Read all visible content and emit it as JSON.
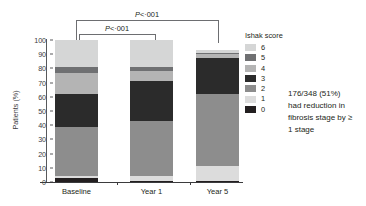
{
  "chart_data": {
    "type": "bar",
    "subtype": "stacked-bar-100",
    "title": "",
    "xlabel": "",
    "ylabel": "Patients (%)",
    "ylim": [
      0,
      100
    ],
    "ytick_values": [
      0,
      10,
      20,
      30,
      40,
      50,
      60,
      70,
      80,
      90,
      100
    ],
    "ytick_labels": [
      "0",
      "10",
      "20",
      "30",
      "40",
      "50",
      "60",
      "70",
      "80",
      "90",
      "100"
    ],
    "grid": false,
    "categories": [
      "Baseline",
      "Year 1",
      "Year 5"
    ],
    "legend_title": "Ishak score",
    "legend_position": "right",
    "legend_order_top_to_bottom": [
      "6",
      "5",
      "4",
      "3",
      "2",
      "1",
      "0"
    ],
    "series": [
      {
        "name": "0",
        "color": "#231f20",
        "values": [
          3,
          1,
          1
        ]
      },
      {
        "name": "1",
        "color": "#dcdcdc",
        "values": [
          1,
          3,
          10
        ]
      },
      {
        "name": "2",
        "color": "#8d8d8d",
        "values": [
          35,
          39,
          51
        ]
      },
      {
        "name": "3",
        "color": "#2b2b2b",
        "values": [
          23,
          28,
          25
        ]
      },
      {
        "name": "4",
        "color": "#b4b4b4",
        "values": [
          15,
          7,
          3
        ]
      },
      {
        "name": "5",
        "color": "#6f7072",
        "values": [
          4,
          3,
          1
        ]
      },
      {
        "name": "6",
        "color": "#d5d6d6",
        "values": [
          19,
          19,
          2
        ]
      }
    ],
    "bar_totals": [
      100,
      100,
      93
    ],
    "annotations": [
      {
        "name": "bracket-baseline-year1",
        "text": "P<·001",
        "from": "Baseline",
        "to": "Year 1"
      },
      {
        "name": "bracket-baseline-year5",
        "text": "P<·001",
        "from": "Baseline",
        "to": "Year 5"
      }
    ],
    "side_note": [
      "176/348 (51%)",
      "had reduction in",
      "fibrosis stage by ≥",
      "1 stage"
    ]
  },
  "axes": {
    "y_label": "Patients (%)",
    "y_ticks": [
      "100",
      "90",
      "80",
      "70",
      "60",
      "50",
      "40",
      "30",
      "20",
      "10",
      "0"
    ],
    "x_labels": [
      "Baseline",
      "Year 1",
      "Year 5"
    ]
  },
  "legend": {
    "title": "Ishak score",
    "items": [
      {
        "label": "6",
        "color": "#d5d6d6"
      },
      {
        "label": "5",
        "color": "#6f7072"
      },
      {
        "label": "4",
        "color": "#b4b4b4"
      },
      {
        "label": "3",
        "color": "#2b2b2b"
      },
      {
        "label": "2",
        "color": "#8d8d8d"
      },
      {
        "label": "1",
        "color": "#dcdcdc"
      },
      {
        "label": "0",
        "color": "#231f20"
      }
    ]
  },
  "brackets": {
    "inner_label_prefix": "P",
    "inner_label_rest": "<·001",
    "outer_label_prefix": "P",
    "outer_label_rest": "<·001"
  },
  "note": {
    "line1": "176/348 (51%)",
    "line2": "had reduction in",
    "line3": "fibrosis stage by ≥",
    "line4": "1 stage"
  }
}
